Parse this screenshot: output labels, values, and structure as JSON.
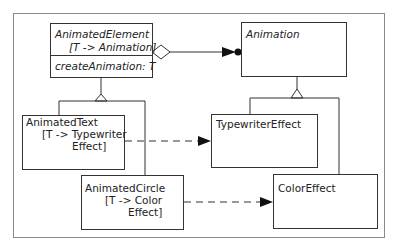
{
  "diagram": {
    "type": "UML class diagram",
    "classes": [
      {
        "id": "animated-element",
        "name": "AnimatedElement",
        "template": "[T -> Animation]",
        "operation": "createAnimation: T",
        "abstract": true
      },
      {
        "id": "animation",
        "name": "Animation",
        "abstract": true
      },
      {
        "id": "animated-text",
        "name": "AnimatedText",
        "binding_line1": "[T -> Typewriter",
        "binding_line2": "Effect]"
      },
      {
        "id": "animated-circle",
        "name": "AnimatedCircle",
        "binding_line1": "[T -> Color",
        "binding_line2": "Effect]"
      },
      {
        "id": "typewriter-effect",
        "name": "TypewriterEffect"
      },
      {
        "id": "color-effect",
        "name": "ColorEffect"
      }
    ],
    "relations": [
      {
        "from": "animated-element",
        "to": "animation",
        "kind": "aggregation"
      },
      {
        "from": "animated-text",
        "to": "animated-element",
        "kind": "generalization"
      },
      {
        "from": "animated-circle",
        "to": "animated-element",
        "kind": "generalization"
      },
      {
        "from": "typewriter-effect",
        "to": "animation",
        "kind": "generalization"
      },
      {
        "from": "color-effect",
        "to": "animation",
        "kind": "generalization"
      },
      {
        "from": "animated-text",
        "to": "typewriter-effect",
        "kind": "dependency"
      },
      {
        "from": "animated-circle",
        "to": "color-effect",
        "kind": "dependency"
      }
    ]
  }
}
